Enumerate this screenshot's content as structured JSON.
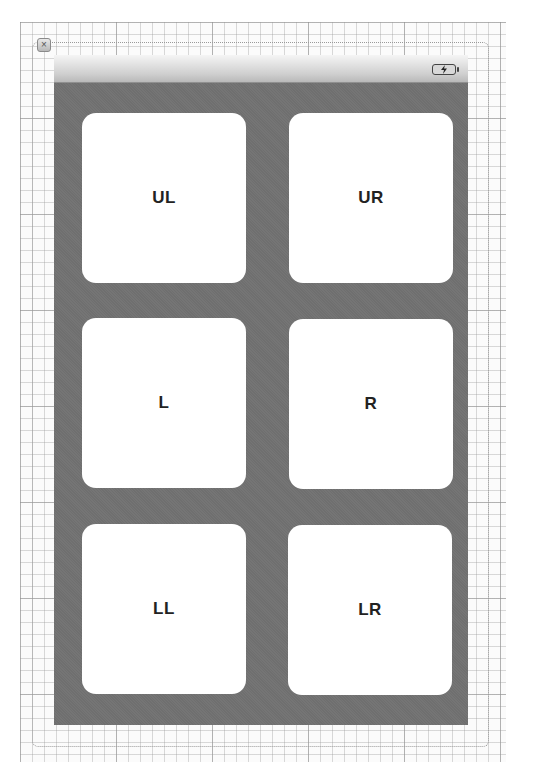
{
  "canvas": {
    "close_icon": "close-icon",
    "close_glyph": "×"
  },
  "device": {
    "status_bar": {
      "battery_icon": "battery-charging-icon"
    },
    "background_color": "#757575",
    "tiles": [
      {
        "id": "upper-left",
        "label": "UL"
      },
      {
        "id": "upper-right",
        "label": "UR"
      },
      {
        "id": "left",
        "label": "L"
      },
      {
        "id": "right",
        "label": "R"
      },
      {
        "id": "lower-left",
        "label": "LL"
      },
      {
        "id": "lower-right",
        "label": "LR"
      }
    ]
  }
}
